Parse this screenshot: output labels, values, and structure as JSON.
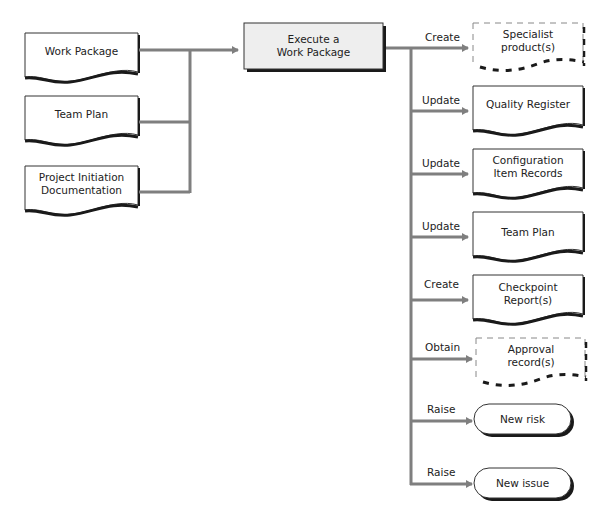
{
  "colors": {
    "connector": "#7f7f7f",
    "outline": "#333333",
    "shadow": "#1a1a1a",
    "process_fill": "#eeeeee"
  },
  "inputs": [
    {
      "label": "Work Package"
    },
    {
      "label": "Team Plan"
    },
    {
      "label": "Project Initiation\nDocumentation"
    }
  ],
  "process": {
    "label": "Execute a\nWork Package"
  },
  "outputs": [
    {
      "verb": "Create",
      "label": "Specialist\nproduct(s)",
      "shape": "dashed-document"
    },
    {
      "verb": "Update",
      "label": "Quality Register",
      "shape": "document"
    },
    {
      "verb": "Update",
      "label": "Configuration\nItem Records",
      "shape": "document"
    },
    {
      "verb": "Update",
      "label": "Team Plan",
      "shape": "document"
    },
    {
      "verb": "Create",
      "label": "Checkpoint Report(s)",
      "shape": "document"
    },
    {
      "verb": "Obtain",
      "label": "Approval\nrecord(s)",
      "shape": "dashed-document"
    },
    {
      "verb": "Raise",
      "label": "New risk",
      "shape": "terminator"
    },
    {
      "verb": "Raise",
      "label": "New issue",
      "shape": "terminator"
    }
  ]
}
